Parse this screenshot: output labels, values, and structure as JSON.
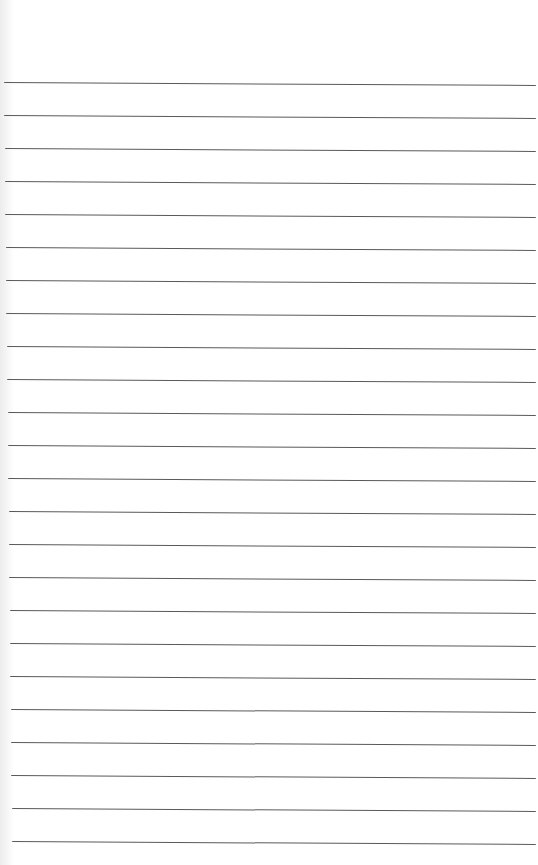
{
  "page": {
    "type": "lined-paper",
    "background_color": "#ffffff",
    "line_color": "#5a5a5a",
    "line_count": 24,
    "line_spacing_px": 33,
    "first_line_y": 82,
    "line_left_x": 4,
    "line_right_x": 536,
    "line_tilt_px": 3
  }
}
